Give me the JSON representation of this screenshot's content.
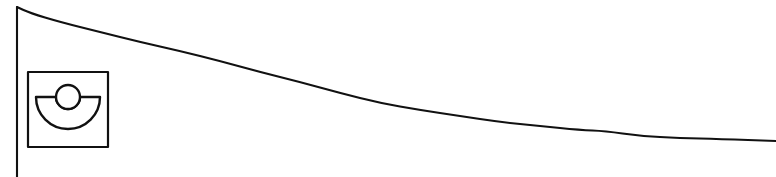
{
  "figure": {
    "background_color": "#ffffff",
    "stroke_color": "#111111",
    "width": 776,
    "height": 177
  },
  "axis": {
    "name": "vertical-axis-line",
    "orientation": "vertical",
    "x": 17,
    "y_top": 7,
    "y_bottom": 177
  },
  "icon": {
    "name": "dome-glyph-icon",
    "semantic": "half-disc-with-circle-icon",
    "frame": {
      "x": 28,
      "y": 72,
      "width": 80,
      "height": 75
    },
    "half_disc": {
      "center_x": 68,
      "flat_top_y": 97,
      "radius_x": 32,
      "radius_y": 32
    },
    "circle": {
      "center_x": 68,
      "center_y": 97,
      "radius": 12
    }
  },
  "chart_data": {
    "type": "line",
    "title": "",
    "xlabel": "",
    "ylabel": "",
    "grid": false,
    "legend": null,
    "xlim": [
      17,
      776
    ],
    "ylim": [
      7,
      141
    ],
    "series": [
      {
        "name": "decay-curve",
        "points": [
          [
            17,
            7
          ],
          [
            30,
            13
          ],
          [
            60,
            22
          ],
          [
            100,
            32
          ],
          [
            140,
            42
          ],
          [
            180,
            51
          ],
          [
            220,
            61
          ],
          [
            260,
            72
          ],
          [
            300,
            82
          ],
          [
            340,
            93
          ],
          [
            380,
            103
          ],
          [
            420,
            110
          ],
          [
            460,
            116
          ],
          [
            500,
            122
          ],
          [
            540,
            126
          ],
          [
            580,
            130
          ],
          [
            605,
            131
          ],
          [
            640,
            136
          ],
          [
            680,
            138
          ],
          [
            720,
            139
          ],
          [
            776,
            141
          ]
        ]
      }
    ]
  }
}
